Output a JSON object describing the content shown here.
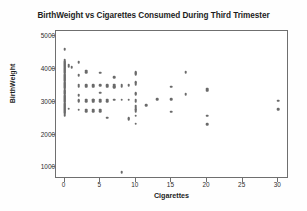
{
  "chart_data": {
    "type": "scatter",
    "title": "BirthWeight vs Cigarettes Consumed During Third Trimester",
    "xlabel": "Cigarettes",
    "ylabel": "BirthWeight",
    "xlim": [
      -1.2,
      31.5
    ],
    "ylim": [
      650,
      5150
    ],
    "xticks": [
      0,
      5,
      10,
      15,
      20,
      25,
      30
    ],
    "yticks": [
      1000,
      2000,
      3000,
      4000,
      5000
    ],
    "grid": false,
    "legend": null,
    "marker_color": "#6a6a6a",
    "frame_color": "#6f6f6f",
    "background": "#ffffff",
    "points": [
      [
        0,
        4590
      ],
      [
        0,
        4280
      ],
      [
        0,
        4240
      ],
      [
        0,
        4210
      ],
      [
        0,
        4170
      ],
      [
        0,
        4140
      ],
      [
        0,
        4110
      ],
      [
        0,
        4080
      ],
      [
        0,
        4060
      ],
      [
        0,
        4040
      ],
      [
        0,
        4010
      ],
      [
        0,
        3990
      ],
      [
        0,
        3960
      ],
      [
        0,
        3930
      ],
      [
        0,
        3900
      ],
      [
        0,
        3880
      ],
      [
        0,
        3850
      ],
      [
        0,
        3820
      ],
      [
        0,
        3800
      ],
      [
        0,
        3770
      ],
      [
        0,
        3740
      ],
      [
        0,
        3720
      ],
      [
        0,
        3690
      ],
      [
        0,
        3660
      ],
      [
        0,
        3640
      ],
      [
        0,
        3610
      ],
      [
        0,
        3580
      ],
      [
        0,
        3560
      ],
      [
        0,
        3530
      ],
      [
        0,
        3500
      ],
      [
        0,
        3480
      ],
      [
        0,
        3450
      ],
      [
        0,
        3420
      ],
      [
        0,
        3400
      ],
      [
        0,
        3370
      ],
      [
        0,
        3340
      ],
      [
        0,
        3320
      ],
      [
        0,
        3290
      ],
      [
        0,
        3260
      ],
      [
        0,
        3240
      ],
      [
        0,
        3210
      ],
      [
        0,
        3180
      ],
      [
        0,
        3160
      ],
      [
        0,
        3130
      ],
      [
        0,
        3100
      ],
      [
        0,
        3080
      ],
      [
        0,
        3050
      ],
      [
        0,
        3020
      ],
      [
        0,
        3000
      ],
      [
        0,
        2970
      ],
      [
        0,
        2940
      ],
      [
        0,
        2920
      ],
      [
        0,
        2890
      ],
      [
        0,
        2860
      ],
      [
        0,
        2840
      ],
      [
        0,
        2810
      ],
      [
        0,
        2780
      ],
      [
        0,
        2750
      ],
      [
        0,
        2720
      ],
      [
        0,
        2690
      ],
      [
        0,
        2660
      ],
      [
        0,
        2630
      ],
      [
        0,
        2600
      ],
      [
        0,
        2570
      ],
      [
        0.6,
        4130
      ],
      [
        0.6,
        4100
      ],
      [
        0.6,
        4060
      ],
      [
        0.6,
        2790
      ],
      [
        1,
        4060
      ],
      [
        1,
        4030
      ],
      [
        2,
        4200
      ],
      [
        2,
        3810
      ],
      [
        2,
        3500
      ],
      [
        2,
        3460
      ],
      [
        2,
        3200
      ],
      [
        2,
        3040
      ],
      [
        2,
        3020
      ],
      [
        2,
        2760
      ],
      [
        3,
        3940
      ],
      [
        3,
        3900
      ],
      [
        3,
        3500
      ],
      [
        3,
        3460
      ],
      [
        3,
        3060
      ],
      [
        3,
        3020
      ],
      [
        3,
        2760
      ],
      [
        3,
        2720
      ],
      [
        4,
        3500
      ],
      [
        4,
        3460
      ],
      [
        4,
        3060
      ],
      [
        4,
        3040
      ],
      [
        4,
        3000
      ],
      [
        4,
        2760
      ],
      [
        4,
        2720
      ],
      [
        5,
        3880
      ],
      [
        5,
        3500
      ],
      [
        5,
        3280
      ],
      [
        5,
        3060
      ],
      [
        5,
        3020
      ],
      [
        5,
        2760
      ],
      [
        5,
        2720
      ],
      [
        6,
        3500
      ],
      [
        6,
        3460
      ],
      [
        6,
        3060
      ],
      [
        6,
        3020
      ],
      [
        6,
        2510
      ],
      [
        7,
        3740
      ],
      [
        7,
        3520
      ],
      [
        7,
        3480
      ],
      [
        7,
        3440
      ],
      [
        7,
        3060
      ],
      [
        8,
        3520
      ],
      [
        8,
        3480
      ],
      [
        8,
        3060
      ],
      [
        8,
        850
      ],
      [
        9,
        3500
      ],
      [
        9,
        3060
      ],
      [
        9,
        2490
      ],
      [
        9,
        2460
      ],
      [
        10,
        3900
      ],
      [
        10,
        3870
      ],
      [
        10,
        3840
      ],
      [
        10,
        3600
      ],
      [
        10,
        3560
      ],
      [
        10,
        3520
      ],
      [
        10,
        3260
      ],
      [
        10,
        3220
      ],
      [
        10,
        3060
      ],
      [
        10,
        3020
      ],
      [
        10,
        2860
      ],
      [
        10,
        2820
      ],
      [
        10,
        2780
      ],
      [
        10,
        2740
      ],
      [
        10,
        2700
      ],
      [
        10,
        2580
      ],
      [
        10,
        2330
      ],
      [
        11.5,
        2900
      ],
      [
        13,
        3080
      ],
      [
        15,
        3460
      ],
      [
        15,
        3080
      ],
      [
        15,
        2700
      ],
      [
        17,
        3900
      ],
      [
        17,
        3230
      ],
      [
        20,
        3400
      ],
      [
        20,
        3370
      ],
      [
        20,
        3330
      ],
      [
        20,
        2580
      ],
      [
        20,
        2310
      ],
      [
        30,
        3030
      ],
      [
        30,
        2770
      ]
    ]
  }
}
